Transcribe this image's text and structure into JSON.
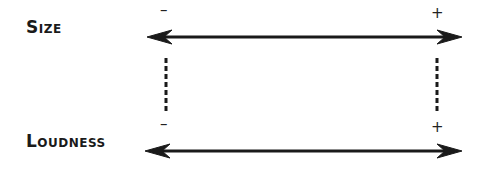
{
  "diagram": {
    "rows": [
      {
        "label": "Size",
        "min_sign": "–",
        "max_sign": "+"
      },
      {
        "label": "Loudness",
        "min_sign": "–",
        "max_sign": "+"
      }
    ],
    "connector_style": "dashed",
    "colors": {
      "ink": "#1a1a1a",
      "background": "#ffffff"
    }
  }
}
